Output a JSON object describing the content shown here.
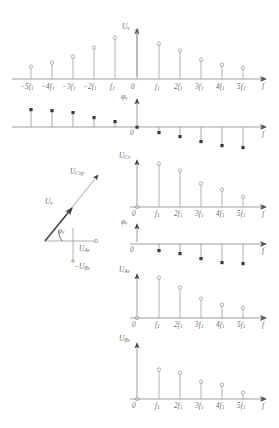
{
  "figure": {
    "style": "hand-drawn technical sketch",
    "ink_color": "#7a7a7a"
  },
  "charts": [
    {
      "id": "chart-uv-two-sided",
      "type": "stem",
      "ylabel": "U",
      "ylabel_sub": "v",
      "xlabel": "f",
      "marker": "open-circle",
      "two_sided": true,
      "origin_label": "0",
      "categories": [
        "-5f1",
        "-4f1",
        "-3f1",
        "-2f1",
        "-f1",
        "0",
        "f1",
        "2f1",
        "3f1",
        "4f1",
        "5f1"
      ],
      "tick_labels": [
        "-5f",
        "-4f",
        "-3f",
        "-2f",
        "f",
        "0",
        "f",
        "2f",
        "3f",
        "4f",
        "5f"
      ],
      "tick_subs": [
        "1",
        "1",
        "1",
        "1",
        "1",
        "",
        "1",
        "1",
        "1",
        "1",
        "1"
      ],
      "values": [
        0.22,
        0.32,
        0.45,
        0.62,
        0.84,
        1.0,
        0.72,
        0.56,
        0.38,
        0.27,
        0.2
      ]
    },
    {
      "id": "chart-phiv-two-sided",
      "type": "stem",
      "ylabel": "φ",
      "ylabel_sub": "v",
      "xlabel": "f",
      "marker": "filled-square",
      "two_sided": true,
      "origin_label": "0",
      "categories": [
        "-5f1",
        "-4f1",
        "-3f1",
        "-2f1",
        "-f1",
        "0",
        "f1",
        "2f1",
        "3f1",
        "4f1",
        "5f1"
      ],
      "values": [
        0.86,
        0.82,
        0.7,
        0.44,
        0.2,
        0.0,
        -0.2,
        -0.42,
        -0.66,
        -0.82,
        -0.9
      ]
    },
    {
      "id": "chart-ucv",
      "type": "stem",
      "ylabel": "U",
      "ylabel_sub": "Cv",
      "xlabel": "f",
      "marker": "open-circle",
      "two_sided": false,
      "origin_label": "0",
      "categories": [
        "0",
        "f1",
        "2f1",
        "3f1",
        "4f1",
        "5f1"
      ],
      "tick_labels": [
        "0",
        "f",
        "2f",
        "3f",
        "4f",
        "5f"
      ],
      "tick_subs": [
        "",
        "1",
        "1",
        "1",
        "1",
        "1"
      ],
      "values": [
        0.0,
        1.0,
        0.82,
        0.52,
        0.38,
        0.22
      ]
    },
    {
      "id": "chart-phiv-one-sided",
      "type": "stem",
      "ylabel": "φ",
      "ylabel_sub": "v",
      "xlabel": "f",
      "marker": "filled-square",
      "two_sided": false,
      "origin_label": "0",
      "categories": [
        "0",
        "f1",
        "2f1",
        "3f1",
        "4f1",
        "5f1"
      ],
      "values": [
        0.0,
        -0.22,
        -0.36,
        -0.62,
        -0.78,
        -0.82
      ]
    },
    {
      "id": "chart-uav",
      "type": "stem",
      "ylabel": "U",
      "ylabel_sub": "Av",
      "xlabel": "f",
      "marker": "open-circle",
      "two_sided": false,
      "origin_label": "0",
      "categories": [
        "0",
        "f1",
        "2f1",
        "3f1",
        "4f1",
        "5f1"
      ],
      "tick_labels": [
        "0",
        "f",
        "2f",
        "3f",
        "4f",
        "5f"
      ],
      "tick_subs": [
        "",
        "1",
        "1",
        "1",
        "1",
        "1"
      ],
      "values": [
        0.0,
        1.0,
        0.72,
        0.46,
        0.3,
        0.24
      ]
    },
    {
      "id": "chart-ubv",
      "type": "stem",
      "ylabel": "U",
      "ylabel_sub": "Bv",
      "xlabel": "f",
      "marker": "open-circle",
      "two_sided": false,
      "origin_label": "0",
      "categories": [
        "0",
        "f1",
        "2f1",
        "3f1",
        "4f1",
        "5f1"
      ],
      "tick_labels": [
        "0",
        "f",
        "2f",
        "3f",
        "4f",
        "5f"
      ],
      "tick_subs": [
        "",
        "1",
        "1",
        "1",
        "1",
        "1"
      ],
      "values": [
        0.0,
        0.72,
        0.64,
        0.42,
        0.34,
        0.12
      ]
    }
  ],
  "phasor": {
    "id": "phasor-diagram",
    "resultant_label": "U",
    "resultant_sub": "Cvp",
    "vector_label": "U",
    "vector_sub": "v",
    "angle_label": "φ",
    "angle_sub": "v",
    "x_component_label": "U",
    "x_component_sub": "Av",
    "y_component_label": "-U",
    "y_component_sub": "Bv"
  }
}
